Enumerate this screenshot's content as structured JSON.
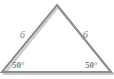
{
  "figure": {
    "kind": "geometry-diagram",
    "shape": "isosceles-triangle",
    "background_color": "#ffffff",
    "stroke_color": "#8c8c8c",
    "stroke_shadow_color": "#c9c9c9",
    "stroke_width": 2,
    "text_color": "#7d7d7d",
    "vertices": {
      "apex": {
        "x": 57,
        "y": 5
      },
      "bottom_left": {
        "x": 2,
        "y": 72
      },
      "bottom_right": {
        "x": 111,
        "y": 72
      }
    },
    "labels": {
      "left_side": "6",
      "right_side": "6",
      "left_angle": "50°",
      "right_angle": "50°"
    }
  }
}
